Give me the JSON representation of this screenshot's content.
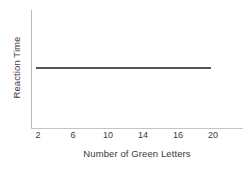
{
  "chart_data": {
    "type": "line",
    "title": "",
    "subtitle": "",
    "xlabel": "Number of Green Letters",
    "ylabel": "Reaction Time",
    "x_ticklabels": [
      "2",
      "6",
      "10",
      "14",
      "16",
      "20"
    ],
    "y_ticklabels": [],
    "xlim": [
      0,
      22
    ],
    "ylim": [
      0,
      1
    ],
    "grid": false,
    "legend": false,
    "legend_position": "none",
    "annotations": [],
    "series": [
      {
        "name": "Reaction Time",
        "color": "#555555",
        "line_width_px": 2,
        "marker": "none",
        "x": [
          "2",
          "6",
          "10",
          "14",
          "16",
          "20"
        ],
        "values": [
          0.52,
          0.52,
          0.52,
          0.52,
          0.52,
          0.52
        ],
        "description": "flat horizontal line — reaction time constant across all numbers of green letters"
      }
    ]
  },
  "axes": {
    "y_axis_color": "#b9b9b9",
    "x_axis_color": "#c4c4c4",
    "background": "#ffffff",
    "text_color": "#3a3a3a"
  }
}
